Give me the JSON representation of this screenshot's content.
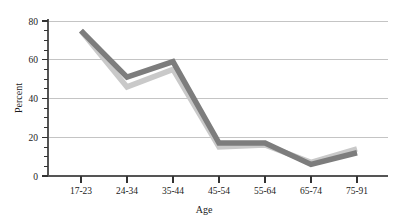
{
  "chart_data": {
    "type": "line",
    "title": "",
    "xlabel": "Age",
    "ylabel": "Percent",
    "categories": [
      "17-23",
      "24-34",
      "35-44",
      "45-54",
      "55-64",
      "65-74",
      "75-91"
    ],
    "series": [
      {
        "name": "series-dark",
        "color": "#7d7d7d",
        "values": [
          75,
          51,
          59,
          17,
          17,
          6,
          12
        ]
      },
      {
        "name": "series-light",
        "color": "#c9c9c9",
        "values": [
          75,
          46,
          55,
          15,
          16,
          7,
          14
        ]
      }
    ],
    "ylim": [
      0,
      80
    ],
    "yticks": [
      0,
      20,
      40,
      60,
      80
    ],
    "ytick_labels": [
      "0",
      "20",
      "40",
      "60",
      "80"
    ],
    "yminor_step": 5,
    "grid": true,
    "grid_color": "#c4c4c4",
    "axis_color": "#555555",
    "legend": "none",
    "background": "#ffffff"
  },
  "axis": {
    "y_title": "Percent",
    "x_title": "Age",
    "tick0": "0",
    "tick20": "20",
    "tick40": "40",
    "tick60": "60",
    "tick80": "80"
  },
  "categories": {
    "c0": "17-23",
    "c1": "24-34",
    "c2": "35-44",
    "c3": "45-54",
    "c4": "55-64",
    "c5": "65-74",
    "c6": "75-91"
  }
}
